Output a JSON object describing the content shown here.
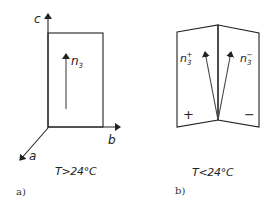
{
  "panel_a": {
    "axes": {
      "c": "c",
      "b": "b",
      "a": "a"
    },
    "vector_label": "n",
    "vector_sub": "3",
    "temperature": "T>24°C",
    "caption": "a)"
  },
  "panel_b": {
    "vector_plus_label": "n",
    "vector_plus_sub": "3",
    "vector_plus_sup": "+",
    "vector_minus_label": "n",
    "vector_minus_sub": "3",
    "vector_minus_sup": "−",
    "domain_plus": "+",
    "domain_minus": "−",
    "temperature": "T<24°C",
    "caption": "b)"
  },
  "colors": {
    "line": "#222222",
    "arrow": "#444444",
    "background": "#ffffff"
  }
}
